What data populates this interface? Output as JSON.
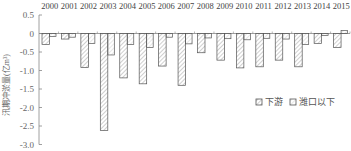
{
  "chart_data": {
    "type": "bar",
    "title": "",
    "xlabel": "",
    "ylabel": "汛期冲淤量(亿m³)",
    "ylim": [
      -3.0,
      0.5
    ],
    "yticks": [
      0.5,
      0,
      -0.5,
      -1.0,
      -1.5,
      -2.0,
      -2.5,
      -3.0
    ],
    "ytick_labels": [
      "0.5",
      "0",
      "-0.5",
      "-1.0",
      "-1.5",
      "-2.0",
      "-2.5",
      "-3.0"
    ],
    "categories": [
      "2000",
      "2001",
      "2002",
      "2003",
      "2004",
      "2005",
      "2006",
      "2007",
      "2008",
      "2009",
      "2010",
      "2011",
      "2012",
      "2013",
      "2014",
      "2015"
    ],
    "category_axis_position": "top",
    "series": [
      {
        "name": "下游",
        "pattern": "hatched",
        "values": [
          -0.3,
          -0.15,
          -0.92,
          -2.62,
          -1.2,
          -1.36,
          -0.88,
          -1.4,
          -0.52,
          -0.72,
          -0.93,
          -0.9,
          -0.72,
          -0.9,
          -0.27,
          -0.38
        ]
      },
      {
        "name": "潍口以下",
        "pattern": "hatched-light",
        "values": [
          -0.08,
          -0.1,
          -0.27,
          -0.58,
          -0.3,
          -0.38,
          -0.1,
          -0.28,
          -0.12,
          -0.14,
          -0.17,
          -0.13,
          -0.15,
          -0.3,
          -0.05,
          0.08
        ]
      }
    ],
    "legend": {
      "position": "inside-right",
      "entries": [
        "下游",
        "潍口以下"
      ]
    },
    "grid": false
  },
  "colors": {
    "axis": "#888888",
    "bar_stroke": "#555555",
    "hatch": "#9a9a9a",
    "background": "#ffffff"
  }
}
